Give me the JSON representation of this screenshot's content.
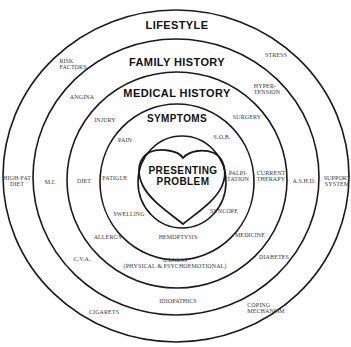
{
  "diagram": {
    "rings": [
      {
        "name": "LIFESTYLE",
        "items": [
          "STRESS",
          "RISK FACTORS",
          "HIGH-FAT DIET",
          "SUPPORT SYSTEM",
          "CIGARETS",
          "COPING MECHANISM"
        ]
      },
      {
        "name": "FAMILY HISTORY",
        "items": [
          "HYPER-TENSION",
          "ANGINA",
          "M.I.",
          "A.S.H.D.",
          "C.V.A.",
          "DIABETES",
          "IDIOPATHICS"
        ]
      },
      {
        "name": "MEDICAL HISTORY",
        "items": [
          "SURGERY",
          "INJURY",
          "DIET",
          "CURRENT THERAPY",
          "ALLERGY",
          "MEDICINE",
          "ILLNESS (PHYSICAL & PSYCHOEMOTIONAL)"
        ]
      },
      {
        "name": "SYMPTOMS",
        "items": [
          "PAIN",
          "S.O.B.",
          "FATIGUE",
          "PALPI-TATION",
          "SWELLING",
          "SYNCOPE",
          "HEMOPTYSIS"
        ]
      }
    ],
    "center": {
      "line1": "PRESENTING",
      "line2": "PROBLEM",
      "shape": "heart"
    }
  },
  "headings": {
    "lifestyle": "LIFESTYLE",
    "family_history": "FAMILY HISTORY",
    "medical_history": "MEDICAL HISTORY",
    "symptoms": "SYMPTOMS",
    "center_line1": "PRESENTING",
    "center_line2": "PROBLEM"
  },
  "labels": {
    "lifestyle": {
      "risk_factors_1": "RISK",
      "risk_factors_2": "FACTORS",
      "stress": "STRESS",
      "high_fat_diet_1": "HIGH-FAT",
      "high_fat_diet_2": "DIET",
      "support_system_1": "SUPPORT",
      "support_system_2": "SYSTEM",
      "cigarets": "CIGARETS",
      "coping_mechanism_1": "COPING",
      "coping_mechanism_2": "MECHANISM"
    },
    "family_history": {
      "angina": "ANGINA",
      "hypertension_1": "HYPER-",
      "hypertension_2": "TENSION",
      "mi": "M.I.",
      "ashd": "A.S.H.D.",
      "cva": "C.V.A.",
      "diabetes": "DIABETES",
      "idiopathics": "IDIOPATHICS"
    },
    "medical_history": {
      "injury": "INJURY",
      "surgery": "SURGERY",
      "diet": "DIET",
      "current_therapy_1": "CURRENT",
      "current_therapy_2": "THERAPY",
      "allergy": "ALLERGY",
      "medicine": "MEDICINE",
      "illness_1": "ILLNESS",
      "illness_2": "(PHYSICAL & PSYCHOEMOTIONAL)"
    },
    "symptoms": {
      "pain": "PAIN",
      "sob": "S.O.B.",
      "fatigue": "FATIGUE",
      "palpitation_1": "PALPI-",
      "palpitation_2": "TATION",
      "swelling": "SWELLING",
      "syncope": "SYNCOPE",
      "hemoptysis": "HEMOPTYSIS"
    }
  },
  "colors": {
    "stroke": "#1a1a1a",
    "heading_text": "#111111",
    "item_text": "#3a3a3a",
    "background": "#ffffff"
  }
}
